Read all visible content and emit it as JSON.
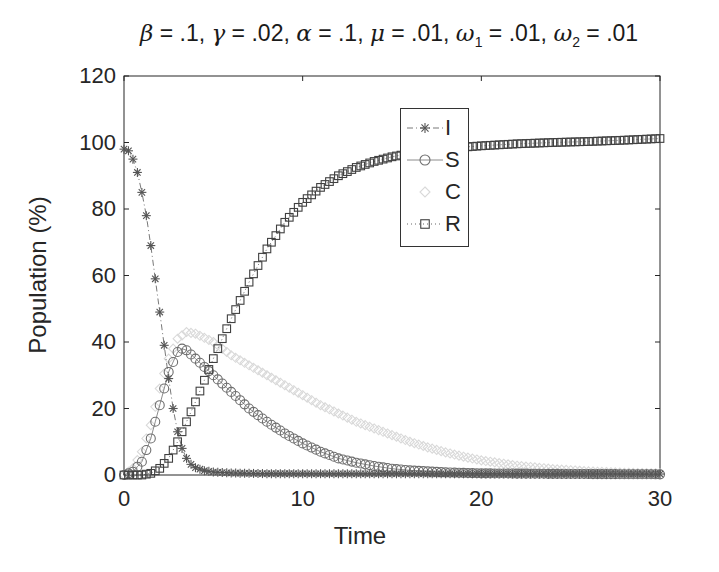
{
  "chart_data": {
    "type": "line",
    "title": "β = .1, γ = .02, α = .1, μ = .01, ω1 = .01, ω2 = .01",
    "title_parts": [
      {
        "sym": "β",
        "text": " = .1, "
      },
      {
        "sym": "γ",
        "text": " = .02, "
      },
      {
        "sym": "α",
        "text": " = .1, "
      },
      {
        "sym": "μ",
        "text": " = .01, "
      },
      {
        "sym": "ω",
        "sub": "1",
        "text": " = .01, "
      },
      {
        "sym": "ω",
        "sub": "2",
        "text": " = .01"
      }
    ],
    "xlabel": "Time",
    "ylabel": "Population (%)",
    "xlim": [
      0,
      30
    ],
    "ylim": [
      0,
      120
    ],
    "xticks": [
      0,
      10,
      20,
      30
    ],
    "yticks": [
      0,
      20,
      40,
      60,
      80,
      100,
      120
    ],
    "grid": false,
    "legend_position": "upper-center-inside",
    "x_step": 0.25,
    "series": [
      {
        "name": "I",
        "marker": "asterisk",
        "line": "dashdot",
        "color": "#555555",
        "keypoints": [
          [
            0,
            98
          ],
          [
            0.25,
            97.5
          ],
          [
            0.5,
            95
          ],
          [
            0.75,
            91
          ],
          [
            1,
            85
          ],
          [
            1.25,
            78
          ],
          [
            1.5,
            69
          ],
          [
            1.75,
            59
          ],
          [
            2,
            49
          ],
          [
            2.25,
            39
          ],
          [
            2.5,
            29
          ],
          [
            2.75,
            20
          ],
          [
            3,
            13
          ],
          [
            3.25,
            8
          ],
          [
            3.5,
            5
          ],
          [
            3.75,
            3.2
          ],
          [
            4,
            2.2
          ],
          [
            4.5,
            1.3
          ],
          [
            5,
            0.9
          ],
          [
            6,
            0.6
          ],
          [
            8,
            0.4
          ],
          [
            30,
            0.3
          ]
        ]
      },
      {
        "name": "S",
        "marker": "circle",
        "line": "solid",
        "color": "#6e6e6e",
        "keypoints": [
          [
            0,
            0
          ],
          [
            0.5,
            1
          ],
          [
            1,
            4
          ],
          [
            1.5,
            11
          ],
          [
            2,
            21
          ],
          [
            2.5,
            31
          ],
          [
            3,
            37
          ],
          [
            3.25,
            38
          ],
          [
            3.5,
            37.5
          ],
          [
            4,
            35
          ],
          [
            5,
            30
          ],
          [
            6,
            25
          ],
          [
            7,
            20
          ],
          [
            8,
            16
          ],
          [
            9,
            12.5
          ],
          [
            10,
            9.5
          ],
          [
            11,
            7
          ],
          [
            12,
            5
          ],
          [
            13,
            3.7
          ],
          [
            14,
            2.7
          ],
          [
            15,
            1.9
          ],
          [
            16,
            1.4
          ],
          [
            18,
            0.8
          ],
          [
            20,
            0.5
          ],
          [
            25,
            0.3
          ],
          [
            30,
            0.2
          ]
        ]
      },
      {
        "name": "C",
        "marker": "diamond",
        "line": "none",
        "color": "#d9d9d9",
        "keypoints": [
          [
            0,
            0
          ],
          [
            0.5,
            2
          ],
          [
            1,
            7
          ],
          [
            1.5,
            15
          ],
          [
            2,
            26
          ],
          [
            2.5,
            35
          ],
          [
            3,
            41
          ],
          [
            3.5,
            43
          ],
          [
            4,
            42.5
          ],
          [
            5,
            40
          ],
          [
            6,
            36
          ],
          [
            7,
            33
          ],
          [
            8,
            30
          ],
          [
            9,
            27
          ],
          [
            10,
            24
          ],
          [
            11,
            21
          ],
          [
            12,
            18.5
          ],
          [
            13,
            16
          ],
          [
            14,
            14
          ],
          [
            15,
            12
          ],
          [
            16,
            10
          ],
          [
            17,
            8.3
          ],
          [
            18,
            6.8
          ],
          [
            19,
            5.5
          ],
          [
            20,
            4.4
          ],
          [
            22,
            2.8
          ],
          [
            24,
            1.8
          ],
          [
            26,
            1.1
          ],
          [
            28,
            0.7
          ],
          [
            30,
            0.5
          ]
        ]
      },
      {
        "name": "R",
        "marker": "square",
        "line": "dotted",
        "color": "#404040",
        "keypoints": [
          [
            0,
            0
          ],
          [
            1,
            0
          ],
          [
            1.5,
            0.5
          ],
          [
            2,
            2
          ],
          [
            2.5,
            5
          ],
          [
            3,
            10
          ],
          [
            3.5,
            16
          ],
          [
            4,
            22
          ],
          [
            5,
            35
          ],
          [
            6,
            47
          ],
          [
            7,
            58
          ],
          [
            8,
            68
          ],
          [
            9,
            76
          ],
          [
            10,
            82
          ],
          [
            11,
            86.5
          ],
          [
            12,
            90
          ],
          [
            13,
            92.5
          ],
          [
            14,
            94.3
          ],
          [
            15,
            95.7
          ],
          [
            16,
            96.7
          ],
          [
            17,
            97.5
          ],
          [
            18,
            98.2
          ],
          [
            20,
            99
          ],
          [
            22,
            99.6
          ],
          [
            24,
            100
          ],
          [
            26,
            100.3
          ],
          [
            28,
            100.7
          ],
          [
            30,
            101.2
          ]
        ]
      }
    ]
  },
  "legend": {
    "items": [
      {
        "label": "I"
      },
      {
        "label": "S"
      },
      {
        "label": "C"
      },
      {
        "label": "R"
      }
    ]
  },
  "axes": {
    "xlabel": "Time",
    "ylabel": "Population (%)",
    "xtick_labels": [
      "0",
      "10",
      "20",
      "30"
    ],
    "ytick_labels": [
      "0",
      "20",
      "40",
      "60",
      "80",
      "100",
      "120"
    ]
  }
}
